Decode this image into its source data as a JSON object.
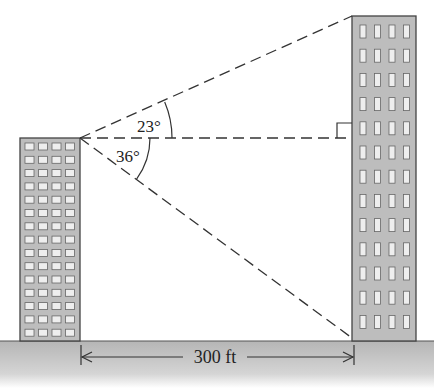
{
  "diagram": {
    "type": "angle-of-elevation-depression",
    "angles": {
      "elevation": {
        "value": 23,
        "label": "23°"
      },
      "depression": {
        "value": 36,
        "label": "36°"
      }
    },
    "distance": {
      "value": 300,
      "unit": "ft",
      "label": "300 ft"
    },
    "left_building": {
      "rows": 15,
      "cols": 4
    },
    "right_building": {
      "rows": 13,
      "cols": 4
    },
    "colors": {
      "building_fill": "#bdbdbd",
      "window_fill": "#eeeeee",
      "outline": "#444444",
      "ground_top": "#b8b8b8",
      "ground_bottom": "#ffffff"
    }
  }
}
